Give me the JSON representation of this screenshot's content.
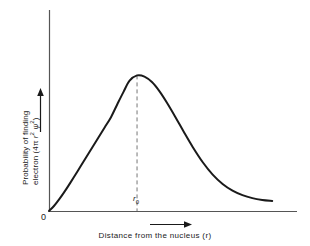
{
  "figure": {
    "background_color": "#ffffff",
    "line_color": "#1a1a1a",
    "axis_color": "#555555",
    "dash_color": "#777777"
  },
  "axes": {
    "origin_label": "0",
    "x_axis_caption": "Distance from the nucleus (r)",
    "x_axis_variable": "r",
    "y_axis_caption_line1": "Probability of finding",
    "y_axis_caption_line2_prefix": "electron (4",
    "y_axis_caption_line2_pi": "π",
    "y_axis_caption_line2_r": "r",
    "y_axis_caption_line2_r_exp": "2",
    "y_axis_caption_line2_psi": "ψ",
    "y_axis_caption_line2_psi_exp": "2",
    "y_axis_caption_line2_suffix": ")",
    "x_arrow_icon": "right-arrow-icon",
    "y_arrow_icon": "up-arrow-icon"
  },
  "annotations": {
    "peak_marker_label_r": "r",
    "peak_marker_label_sub": "0",
    "peak_marker_style": "dashed-vertical-line"
  },
  "chart_data": {
    "type": "line",
    "title": "",
    "xlabel": "Distance from the nucleus (r)",
    "ylabel": "Probability of finding electron (4π r² ψ²)",
    "grid": false,
    "legend": null,
    "xlim": [
      0,
      1
    ],
    "ylim": [
      0,
      1
    ],
    "x_tick_labels": [
      "0",
      "r₀"
    ],
    "x_tick_values": [
      0.0,
      0.355
    ],
    "y_tick_labels": [],
    "annotations": [
      {
        "label": "r₀",
        "x": 0.355,
        "y": 0.0,
        "note": "most probable radius; dashed vertical line from curve maximum to x-axis"
      }
    ],
    "series": [
      {
        "name": "Radial probability distribution",
        "x": [
          0.0,
          0.02,
          0.04,
          0.06,
          0.08,
          0.1,
          0.125,
          0.15,
          0.175,
          0.2,
          0.225,
          0.25,
          0.275,
          0.3,
          0.325,
          0.355,
          0.385,
          0.415,
          0.445,
          0.475,
          0.51,
          0.545,
          0.58,
          0.62,
          0.66,
          0.7,
          0.74,
          0.78,
          0.82,
          0.86,
          0.9
        ],
        "y": [
          0.0,
          0.03,
          0.068,
          0.11,
          0.155,
          0.202,
          0.262,
          0.322,
          0.382,
          0.442,
          0.502,
          0.562,
          0.638,
          0.712,
          0.78,
          0.812,
          0.805,
          0.772,
          0.718,
          0.65,
          0.562,
          0.47,
          0.382,
          0.292,
          0.218,
          0.162,
          0.122,
          0.095,
          0.077,
          0.066,
          0.06
        ]
      }
    ]
  }
}
